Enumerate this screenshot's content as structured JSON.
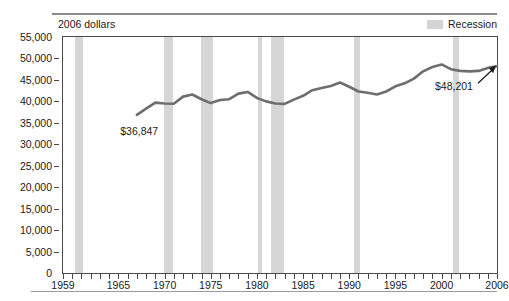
{
  "chart_data": {
    "type": "line",
    "title": "",
    "subtitle": "",
    "units_label": "2006 dollars",
    "xlabel": "",
    "ylabel": "",
    "xlim": [
      1959,
      2006
    ],
    "ylim": [
      0,
      55000
    ],
    "ytick_labels": [
      "55,000",
      "50,000",
      "45,000",
      "40,000",
      "35,000",
      "30,000",
      "25,000",
      "20,000",
      "15,000",
      "10,000",
      "5,000",
      "0"
    ],
    "ytick_values": [
      55000,
      50000,
      45000,
      40000,
      35000,
      30000,
      25000,
      20000,
      15000,
      10000,
      5000,
      0
    ],
    "xtick_labels": [
      "1959",
      "1965",
      "1970",
      "1975",
      "1980",
      "1985",
      "1990",
      "1995",
      "2000",
      "2006"
    ],
    "xtick_values": [
      1959,
      1965,
      1970,
      1975,
      1980,
      1985,
      1990,
      1995,
      2000,
      2006
    ],
    "grid": false,
    "legend": [
      {
        "label": "Recession",
        "color": "#d6d6d6",
        "type": "band"
      }
    ],
    "legend_position": "top-right",
    "line_color": "#6e6e6e",
    "series": [
      {
        "name": "Median household income",
        "x": [
          1967,
          1968,
          1969,
          1970,
          1971,
          1972,
          1973,
          1974,
          1975,
          1976,
          1977,
          1978,
          1979,
          1980,
          1981,
          1982,
          1983,
          1984,
          1985,
          1986,
          1987,
          1988,
          1989,
          1990,
          1991,
          1992,
          1993,
          1994,
          1995,
          1996,
          1997,
          1998,
          1999,
          2000,
          2001,
          2002,
          2003,
          2004,
          2005,
          2006
        ],
        "values": [
          36847,
          38290,
          39700,
          39500,
          39450,
          41100,
          41600,
          40500,
          39600,
          40300,
          40500,
          41800,
          42200,
          40800,
          40000,
          39500,
          39400,
          40400,
          41300,
          42600,
          43100,
          43600,
          44400,
          43400,
          42300,
          42000,
          41600,
          42300,
          43500,
          44200,
          45300,
          47000,
          48000,
          48600,
          47500,
          47100,
          47000,
          47100,
          47800,
          48201
        ]
      }
    ],
    "annotations": [
      {
        "id": "start",
        "text": "$36,847",
        "x": 1967,
        "y": 36847
      },
      {
        "id": "end",
        "text": "$48,201",
        "x": 2006,
        "y": 48201,
        "arrow": true
      }
    ],
    "recession_bands": [
      {
        "start": 1960.3,
        "end": 1961.2
      },
      {
        "start": 1969.9,
        "end": 1970.9
      },
      {
        "start": 1973.9,
        "end": 1975.2
      },
      {
        "start": 1980.1,
        "end": 1980.6
      },
      {
        "start": 1981.5,
        "end": 1982.9
      },
      {
        "start": 1990.5,
        "end": 1991.2
      },
      {
        "start": 2001.2,
        "end": 2001.9
      }
    ]
  }
}
